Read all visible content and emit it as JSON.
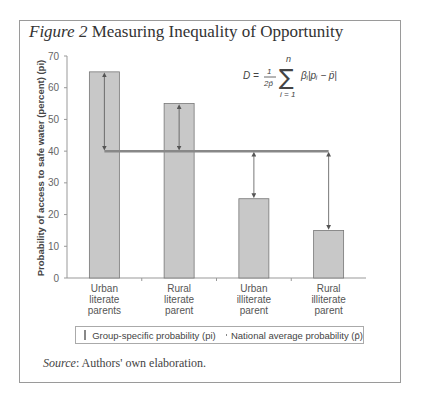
{
  "figure": {
    "label": "Figure 2",
    "title": "Measuring Inequality of Opportunity",
    "source_label": "Source",
    "source_text": ": Authors' own elaboration."
  },
  "formula": {
    "lhs": "D =",
    "frac_num": "1",
    "frac_den": "2p̄",
    "sum_upper": "n",
    "sum_lower": "i = 1",
    "body": "βi|pi − p̄|"
  },
  "legend": {
    "bar_label": "Group-specific probability (pi)",
    "line_label": "National average probability (p̄)"
  },
  "chart_data": {
    "type": "bar",
    "title": "Measuring Inequality of Opportunity",
    "xlabel": "",
    "ylabel": "Probability of access to safe water (percent) (pi)",
    "ylim": [
      0,
      70
    ],
    "yticks": [
      0,
      10,
      20,
      30,
      40,
      50,
      60,
      70
    ],
    "categories": [
      "Urban literate parents",
      "Rural literate parent",
      "Urban illiterate parent",
      "Rural illiterate parent"
    ],
    "category_lines": [
      [
        "Urban",
        "literate",
        "parents"
      ],
      [
        "Rural",
        "literate",
        "parent"
      ],
      [
        "Urban",
        "illiterate",
        "parent"
      ],
      [
        "Rural",
        "illiterate",
        "parent"
      ]
    ],
    "series": [
      {
        "name": "Group-specific probability (pi)",
        "type": "bar",
        "values": [
          65,
          55,
          25,
          15
        ],
        "color": "#c8c8c8"
      },
      {
        "name": "National average probability (p̄)",
        "type": "line",
        "values": [
          40,
          40,
          40,
          40
        ],
        "color": "#888888"
      }
    ],
    "annotations": "Double-headed arrows show deviation of each group from national average",
    "grid": false,
    "legend_position": "bottom"
  }
}
